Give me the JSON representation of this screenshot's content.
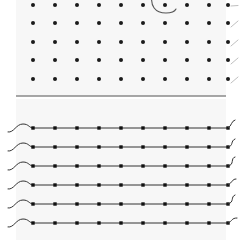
{
  "figure": {
    "title": "",
    "background_color": "#ffffff",
    "panel_fill": "#f7f7f7",
    "width": 239,
    "height": 240
  },
  "chart_data": [
    {
      "type": "scatter",
      "name": "top-dot-grid-panel",
      "title": "",
      "xlabel": "",
      "ylabel": "",
      "grid": false,
      "legend_position": "none",
      "marker": "circle",
      "marker_color": "#1a1a1a",
      "marker_size": 3.2,
      "xlim": [
        0,
        10
      ],
      "ylim": [
        0,
        5
      ],
      "x": [
        1,
        2,
        3,
        4,
        5,
        6,
        7,
        8,
        9,
        10
      ],
      "series": [
        {
          "name": "row-1",
          "y_constant": 5,
          "values": [
            5,
            5,
            5,
            5,
            5,
            5,
            5,
            5,
            5,
            5
          ]
        },
        {
          "name": "row-2",
          "y_constant": 4,
          "values": [
            4,
            4,
            4,
            4,
            4,
            4,
            4,
            4,
            4,
            4
          ]
        },
        {
          "name": "row-3",
          "y_constant": 3,
          "values": [
            3,
            3,
            3,
            3,
            3,
            3,
            3,
            3,
            3,
            3
          ]
        },
        {
          "name": "row-4",
          "y_constant": 2,
          "values": [
            2,
            2,
            2,
            2,
            2,
            2,
            2,
            2,
            2,
            2
          ]
        },
        {
          "name": "row-5",
          "y_constant": 1,
          "values": [
            1,
            1,
            1,
            1,
            1,
            1,
            1,
            1,
            1,
            1
          ]
        }
      ],
      "annotations": [
        {
          "name": "clipped-arc",
          "kind": "arc",
          "color": "#555555",
          "linewidth": 1.1,
          "description": "arc clipped at top edge passing near column 7 of row 1"
        }
      ],
      "edge_ticks": {
        "name": "right-edge-diagonal-ticks",
        "count": 5,
        "color": "#b8b8b8",
        "description": "faint diagonal tick strokes at right margin, one per dot row"
      }
    },
    {
      "type": "line",
      "name": "bottom-marked-lines-panel",
      "title": "",
      "xlabel": "",
      "ylabel": "",
      "grid": false,
      "legend_position": "none",
      "marker": "square",
      "marker_color": "#111111",
      "marker_size": 3.4,
      "line_color": "#333333",
      "linewidth": 1.0,
      "xlim": [
        0,
        10
      ],
      "ylim": [
        0,
        6
      ],
      "x": [
        1,
        2,
        3,
        4,
        5,
        6,
        7,
        8,
        9,
        10
      ],
      "series": [
        {
          "name": "trace-1",
          "y_constant": 6,
          "values": [
            6,
            6,
            6,
            6,
            6,
            6,
            6,
            6,
            6,
            6
          ],
          "lead_in": "wave",
          "tail": "hook"
        },
        {
          "name": "trace-2",
          "y_constant": 5,
          "values": [
            5,
            5,
            5,
            5,
            5,
            5,
            5,
            5,
            5,
            5
          ],
          "lead_in": "wave",
          "tail": "hook"
        },
        {
          "name": "trace-3",
          "y_constant": 4,
          "values": [
            4,
            4,
            4,
            4,
            4,
            4,
            4,
            4,
            4,
            4
          ],
          "lead_in": "wave",
          "tail": "hook"
        },
        {
          "name": "trace-4",
          "y_constant": 3,
          "values": [
            3,
            3,
            3,
            3,
            3,
            3,
            3,
            3,
            3,
            3
          ],
          "lead_in": "wave",
          "tail": "hook"
        },
        {
          "name": "trace-5",
          "y_constant": 2,
          "values": [
            2,
            2,
            2,
            2,
            2,
            2,
            2,
            2,
            2,
            2
          ],
          "lead_in": "wave",
          "tail": "hook"
        },
        {
          "name": "trace-6",
          "y_constant": 1,
          "values": [
            1,
            1,
            1,
            1,
            1,
            1,
            1,
            1,
            1,
            1
          ],
          "lead_in": "wave",
          "tail": "hook"
        }
      ]
    }
  ],
  "divider": {
    "name": "panel-divider",
    "color": "#8a8a8a",
    "linewidth": 1.4,
    "x_start": 16,
    "x_end": 226,
    "y": 96
  },
  "geometry": {
    "dot_columns_x": [
      33,
      55,
      77,
      99,
      121,
      143,
      165,
      187,
      209,
      228
    ],
    "top_rows_y": [
      5,
      23,
      42,
      60,
      79
    ],
    "bottom_rows_y": [
      128,
      147,
      166,
      185,
      204,
      223
    ],
    "marker_columns_x": [
      33,
      55,
      77,
      99,
      121,
      143,
      165,
      187,
      209,
      228
    ]
  }
}
